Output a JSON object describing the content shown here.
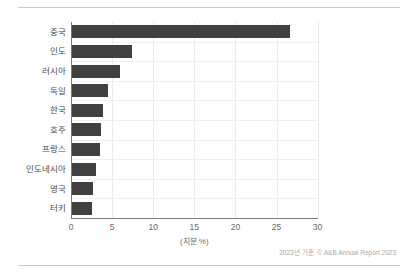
{
  "chart_data": {
    "type": "bar",
    "orientation": "horizontal",
    "title": "",
    "xlabel": "(지분 %)",
    "ylabel": "",
    "xlim": [
      0,
      30
    ],
    "xticks": [
      0,
      5,
      10,
      15,
      20,
      25,
      30
    ],
    "grid": true,
    "legend": null,
    "categories": [
      "중국",
      "인도",
      "러시아",
      "독일",
      "한국",
      "호주",
      "프랑스",
      "인도네시아",
      "영국",
      "터키"
    ],
    "values": [
      26.6,
      7.4,
      6.0,
      4.5,
      3.9,
      3.6,
      3.5,
      3.1,
      2.7,
      2.6
    ],
    "bar_color": "#404040"
  },
  "footnote": "2023년 기준. © A&B Annual Report 2023",
  "colors": {
    "bar": "#404040",
    "grid": "#ebebeb",
    "axis": "#7a7a7a",
    "rule": "#c9c9c9",
    "text": "#4a4a4a",
    "muted_text": "#a8a8a8",
    "background": "#ffffff"
  }
}
